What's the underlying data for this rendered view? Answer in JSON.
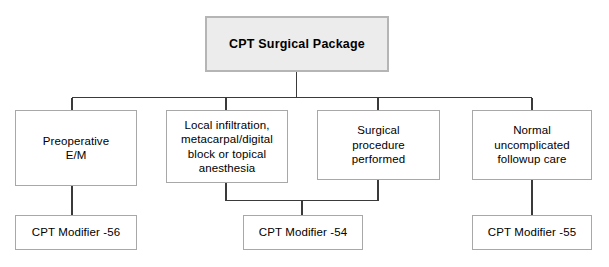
{
  "diagram": {
    "type": "flowchart",
    "title_node": {
      "id": "cpt-surgical-package",
      "label": "CPT Surgical Package",
      "fill": "#ececec",
      "border": "#b5b5b5"
    },
    "middle_row": [
      {
        "id": "preoperative-em",
        "label": "Preoperative\nE/M"
      },
      {
        "id": "local-anesthesia",
        "label": "Local infiltration,\nmetacarpal/digital\nblock or topical\nanesthesia"
      },
      {
        "id": "surgical-procedure",
        "label": "Surgical\nprocedure\nperformed"
      },
      {
        "id": "followup-care",
        "label": "Normal\nuncomplicated\nfollowup care"
      }
    ],
    "bottom_row": [
      {
        "id": "cpt-modifier-56",
        "label": "CPT Modifier -56"
      },
      {
        "id": "cpt-modifier-54",
        "label": "CPT Modifier -54"
      },
      {
        "id": "cpt-modifier-55",
        "label": "CPT Modifier -55"
      }
    ],
    "colors": {
      "background": "#ffffff",
      "box_fill": "#ffffff",
      "box_border": "#a8a8a8",
      "connector": "#3a3a3a",
      "text": "#000000"
    }
  }
}
